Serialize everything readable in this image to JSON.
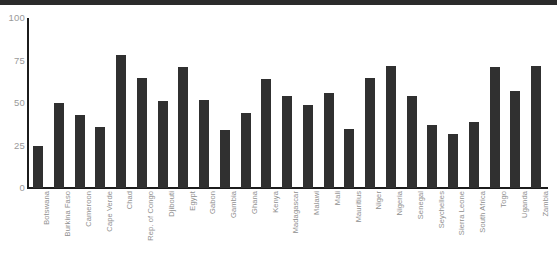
{
  "chart_data": {
    "type": "bar",
    "title": "",
    "xlabel": "",
    "ylabel": "",
    "ylim": [
      0,
      100
    ],
    "yticks": [
      0,
      25,
      50,
      75,
      100
    ],
    "ytick_labels": [
      "0",
      "25",
      "50",
      "75",
      "100"
    ],
    "grid": false,
    "legend": null,
    "bar_color": "#303030",
    "axis_color": "#1c1c1c",
    "label_color": "#8f8f8f",
    "categories": [
      "Botswana",
      "Burkina Faso",
      "Cameroon",
      "Cape Verde",
      "Chad",
      "Rep. of Congo",
      "Djibouti",
      "Egypt",
      "Gabon",
      "Gambia",
      "Ghana",
      "Kenya",
      "Madagascar",
      "Malawi",
      "Mali",
      "Mauritius",
      "Niger",
      "Nigeria",
      "Senegal",
      "Seychelles",
      "Sierra Leone",
      "South Africa",
      "Togo",
      "Uganda",
      "Zambia"
    ],
    "values": [
      25,
      50,
      43,
      36,
      78,
      65,
      51,
      71,
      52,
      34,
      44,
      64,
      54,
      49,
      56,
      35,
      65,
      72,
      54,
      37,
      32,
      39,
      71,
      57,
      72
    ]
  }
}
